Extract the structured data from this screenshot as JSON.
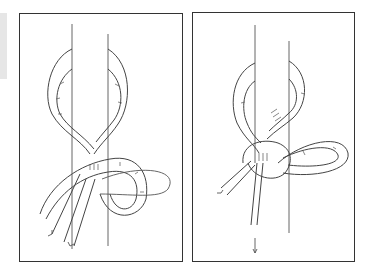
{
  "figure": {
    "type": "knot-tying-instructions",
    "panels": [
      {
        "id": "step-1",
        "description": "Rope formed into a loop with working end passed through, arrows indicate pull direction"
      },
      {
        "id": "step-2",
        "description": "Knot partly tightened, second loop formed, arrows indicate pull direction"
      }
    ],
    "colors": {
      "line": "#333333",
      "background": "#ffffff",
      "side_strip": "#e6e6e6"
    }
  }
}
